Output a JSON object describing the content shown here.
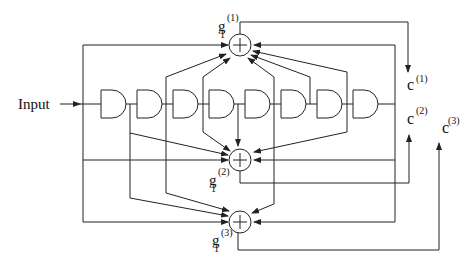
{
  "diagram": {
    "title": "",
    "input_label": "Input",
    "flipflop_count": 8,
    "adders": [
      {
        "id": "g1",
        "label_base": "g",
        "label_sub": "1",
        "label_sup": "(1)",
        "symbol": "+"
      },
      {
        "id": "g2",
        "label_base": "g",
        "label_sub": "1",
        "label_sup": "(2)",
        "symbol": "+"
      },
      {
        "id": "g3",
        "label_base": "g",
        "label_sub": "1",
        "label_sup": "(3)",
        "symbol": "+"
      }
    ],
    "outputs": [
      {
        "id": "c1",
        "label_base": "c",
        "label_sup": "(1)"
      },
      {
        "id": "c2",
        "label_base": "c",
        "label_sup": "(2)"
      },
      {
        "id": "c3",
        "label_base": "c",
        "label_sup": "(3)"
      }
    ],
    "colors": {
      "line": "#222222",
      "background": "#ffffff"
    }
  }
}
